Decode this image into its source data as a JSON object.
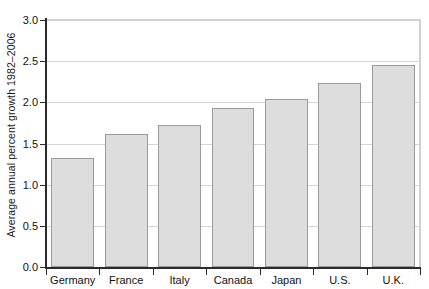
{
  "chart_data": {
    "type": "bar",
    "title": "",
    "xlabel": "",
    "ylabel": "Average annual percent growth 1982–2006",
    "categories": [
      "Germany",
      "France",
      "Italy",
      "Canada",
      "Japan",
      "U.S.",
      "U.K."
    ],
    "values": [
      1.32,
      1.62,
      1.72,
      1.93,
      2.04,
      2.24,
      2.45
    ],
    "ylim": [
      0.0,
      3.0
    ],
    "ytick_values": [
      0.0,
      0.5,
      1.0,
      1.5,
      2.0,
      2.5,
      3.0
    ],
    "ytick_labels": [
      "0.0",
      "0.5",
      "1.0",
      "1.5",
      "2.0",
      "2.5",
      "3.0"
    ],
    "grid": true,
    "grid_axis": "y",
    "legend": false,
    "legend_position": "none",
    "bar_fill_color": "#dddddd",
    "bar_edge_color": "#9a9a9a",
    "gridline_color": "#d2d4d6",
    "axis_color": "#2b2b2b",
    "background_color": "#ffffff"
  }
}
